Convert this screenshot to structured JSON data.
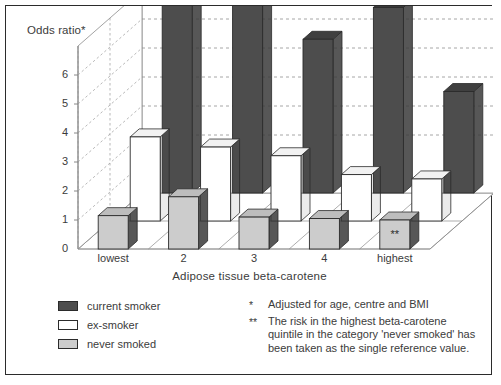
{
  "chart_data": {
    "type": "bar",
    "title": "",
    "ylabel": "Odds ratio*",
    "xlabel": "Adipose tissue beta-carotene",
    "categories": [
      "lowest",
      "2",
      "3",
      "4",
      "highest"
    ],
    "yticks": [
      "0",
      "1",
      "2",
      "3",
      "4",
      "5",
      "6"
    ],
    "ylim": [
      0,
      7
    ],
    "grid": true,
    "legend_position": "below-left",
    "projection": "3d-depth",
    "series": [
      {
        "name": "current smoker",
        "color": "#4d4d4d",
        "values": [
          6.5,
          6.5,
          5.3,
          6.4,
          3.5
        ]
      },
      {
        "name": "ex-smoker",
        "color": "#ffffff",
        "values": [
          2.9,
          2.55,
          2.25,
          1.6,
          1.45
        ]
      },
      {
        "name": "never smoked",
        "color": "#cccccc",
        "values": [
          1.15,
          1.8,
          1.1,
          1.05,
          1.0
        ]
      }
    ],
    "annotations": [
      {
        "text": "**",
        "series": "never smoked",
        "category": "highest"
      }
    ]
  },
  "legend": {
    "items": [
      {
        "label": "current smoker",
        "color": "#4d4d4d"
      },
      {
        "label": "ex-smoker",
        "color": "#ffffff"
      },
      {
        "label": "never smoked",
        "color": "#cccccc"
      }
    ]
  },
  "footnotes": [
    {
      "mark": "*",
      "text": "Adjusted for age, centre and BMI"
    },
    {
      "mark": "**",
      "text": "The risk in the highest beta-carotene quintile in the category 'never smoked' has been taken as the single reference value."
    }
  ]
}
